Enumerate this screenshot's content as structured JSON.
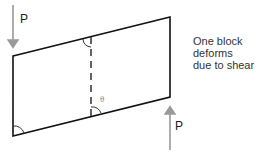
{
  "diagram": {
    "load_top_label": "P",
    "load_bottom_label": "P",
    "angle_label": "θ",
    "caption": {
      "line1": "One block",
      "line2": "deforms",
      "line3": "due to shear"
    },
    "colors": {
      "outline": "#111111",
      "arrow": "#999999",
      "text": "#333333"
    }
  }
}
